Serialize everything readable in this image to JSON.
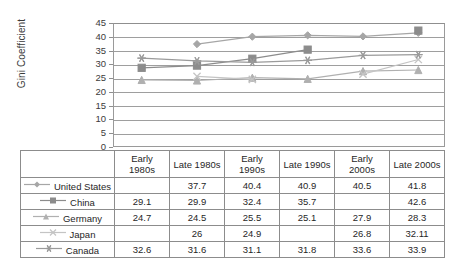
{
  "chart_data": {
    "type": "line",
    "title": "",
    "xlabel": "",
    "ylabel": "Gini Coefficient",
    "ylim": [
      0,
      45
    ],
    "ytick_step": 5,
    "yticks": [
      0,
      5,
      10,
      15,
      20,
      25,
      30,
      35,
      40,
      45
    ],
    "grid": true,
    "legend_position": "table-left-column",
    "categories": [
      "Early 1980s",
      "Late 1980s",
      "Early 1990s",
      "Late 1990s",
      "Early 2000s",
      "Late 2000s"
    ],
    "series": [
      {
        "name": "United States",
        "marker": "diamond",
        "color": "#a6a6a6",
        "values": [
          null,
          37.7,
          40.4,
          40.9,
          40.5,
          41.8
        ]
      },
      {
        "name": "China",
        "marker": "square",
        "color": "#8c8c8c",
        "values": [
          29.1,
          29.9,
          32.4,
          35.7,
          null,
          42.6
        ]
      },
      {
        "name": "Germany",
        "marker": "triangle",
        "color": "#b0b0b0",
        "values": [
          24.7,
          24.5,
          25.5,
          25.1,
          27.9,
          28.3
        ]
      },
      {
        "name": "Japan",
        "marker": "x",
        "color": "#c4c4c4",
        "values": [
          null,
          26,
          24.9,
          null,
          26.8,
          32.11
        ]
      },
      {
        "name": "Canada",
        "marker": "asterisk",
        "color": "#9b9b9b",
        "values": [
          32.6,
          31.6,
          31.1,
          31.8,
          33.6,
          33.9
        ]
      }
    ]
  },
  "table": {
    "corner_label": "",
    "columns": [
      "Early 1980s",
      "Late 1980s",
      "Early 1990s",
      "Late 1990s",
      "Early 2000s",
      "Late 2000s"
    ],
    "column_lines": [
      [
        "Early",
        "1980s"
      ],
      [
        "Late 1980s"
      ],
      [
        "Early",
        "1990s"
      ],
      [
        "Late 1990s"
      ],
      [
        "Early",
        "2000s"
      ],
      [
        "Late 2000s"
      ]
    ],
    "rows": [
      {
        "label": "United States",
        "marker": "diamond",
        "cells": [
          "",
          "37.7",
          "40.4",
          "40.9",
          "40.5",
          "41.8"
        ]
      },
      {
        "label": "China",
        "marker": "square",
        "cells": [
          "29.1",
          "29.9",
          "32.4",
          "35.7",
          "",
          "42.6"
        ]
      },
      {
        "label": "Germany",
        "marker": "triangle",
        "cells": [
          "24.7",
          "24.5",
          "25.5",
          "25.1",
          "27.9",
          "28.3"
        ]
      },
      {
        "label": "Japan",
        "marker": "x",
        "cells": [
          "",
          "26",
          "24.9",
          "",
          "26.8",
          "32.11"
        ]
      },
      {
        "label": "Canada",
        "marker": "asterisk",
        "cells": [
          "32.6",
          "31.6",
          "31.1",
          "31.8",
          "33.6",
          "33.9"
        ]
      }
    ]
  },
  "colors": {
    "grid": "#9e9e9e",
    "axis": "#8f8f8f",
    "border": "#8c8c8c",
    "text": "#1f1f1f"
  }
}
